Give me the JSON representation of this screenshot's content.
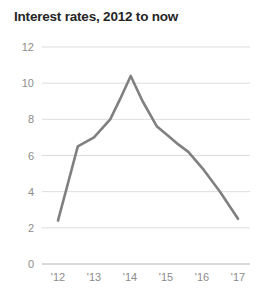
{
  "chart_data": {
    "type": "line",
    "title": "Interest rates, 2012 to now",
    "xlabel": "",
    "ylabel": "",
    "ylim": [
      0,
      12
    ],
    "yticks": [
      0,
      2,
      4,
      6,
      8,
      10,
      12
    ],
    "ytick_labels": [
      "0",
      "2",
      "4",
      "6",
      "8",
      "10",
      "12"
    ],
    "xlim": [
      2012,
      2017
    ],
    "xticks": [
      2012,
      2013,
      2014,
      2015,
      2016,
      2017
    ],
    "xtick_labels": [
      "'12",
      "'13",
      "'14",
      "'15",
      "'16",
      "'17"
    ],
    "grid": true,
    "legend": false,
    "line_color": "#808080",
    "title_color": "#262626",
    "tick_color": "#8c8c8c",
    "grid_color": "#d4d4d4",
    "series": [
      {
        "name": "Interest rate",
        "x": [
          2012.0,
          2012.55,
          2013.0,
          2013.45,
          2013.72,
          2014.02,
          2014.35,
          2014.75,
          2015.05,
          2015.35,
          2015.62,
          2016.05,
          2016.5,
          2017.0
        ],
        "values": [
          2.4,
          6.5,
          7.0,
          8.0,
          9.1,
          10.4,
          9.0,
          7.6,
          7.1,
          6.6,
          6.2,
          5.2,
          4.0,
          2.5
        ]
      }
    ]
  }
}
